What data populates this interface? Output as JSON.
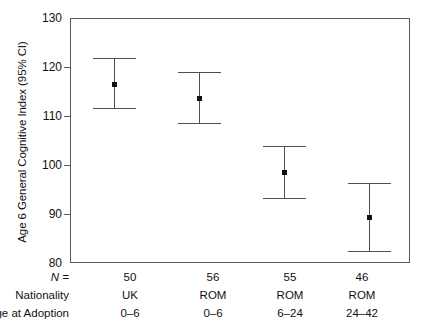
{
  "chart_data": {
    "type": "scatter",
    "title": "",
    "xlabel": "",
    "ylabel": "Age 6 General Cognitive Index (95% CI)",
    "ylim": [
      80,
      130
    ],
    "yticks": [
      80,
      90,
      100,
      110,
      120,
      130
    ],
    "ytick_labels": [
      "80",
      "90",
      "100",
      "110",
      "120",
      "130"
    ],
    "grid": false,
    "legend": "none",
    "error_bar_type": "95% CI",
    "categories": [
      "UK 0-6",
      "ROM 0-6",
      "ROM 6-24",
      "ROM 24-42"
    ],
    "points": [
      {
        "group": "UK 0-6",
        "n": 50,
        "nationality": "UK",
        "age_at_adoption": "0–6",
        "mean": 116.8,
        "ci_low": 111.8,
        "ci_high": 122.0
      },
      {
        "group": "ROM 0-6",
        "n": 56,
        "nationality": "ROM",
        "age_at_adoption": "0–6",
        "mean": 113.9,
        "ci_low": 108.7,
        "ci_high": 119.1
      },
      {
        "group": "ROM 6-24",
        "n": 55,
        "nationality": "ROM",
        "age_at_adoption": "6–24",
        "mean": 98.8,
        "ci_low": 93.4,
        "ci_high": 104.0
      },
      {
        "group": "ROM 24-42",
        "n": 46,
        "nationality": "ROM",
        "age_at_adoption": "24–42",
        "mean": 89.6,
        "ci_low": 82.6,
        "ci_high": 96.6
      }
    ]
  },
  "axis": {
    "y_title": "Age 6 General Cognitive Index (95% CI)"
  },
  "bottom_table": {
    "row_labels": {
      "n": "N =",
      "nationality": "Nationality",
      "age_at_adoption": "Age at Adoption"
    },
    "n_values": [
      "50",
      "56",
      "55",
      "46"
    ],
    "nationality_values": [
      "UK",
      "ROM",
      "ROM",
      "ROM"
    ],
    "age_values": [
      "0–6",
      "0–6",
      "6–24",
      "24–42"
    ]
  },
  "colors": {
    "axis": "#5a5a5a",
    "errorbar": "#4f4f4f",
    "marker": "#111111",
    "text": "#111111",
    "background": "#ffffff"
  }
}
